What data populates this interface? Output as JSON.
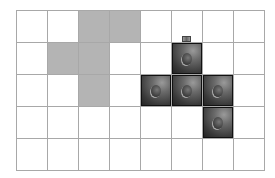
{
  "grid": {
    "columns": 8,
    "rows": 5,
    "line_color": "#a8a8a8",
    "gray_color": "#b4b4b4",
    "gray_cells": [
      [
        0,
        2
      ],
      [
        0,
        3
      ],
      [
        1,
        1
      ],
      [
        1,
        2
      ],
      [
        2,
        2
      ]
    ],
    "cube_cells": [
      [
        1,
        5
      ],
      [
        2,
        4
      ],
      [
        2,
        5
      ],
      [
        2,
        6
      ],
      [
        3,
        6
      ]
    ],
    "tab_on_cube": [
      1,
      5
    ]
  }
}
